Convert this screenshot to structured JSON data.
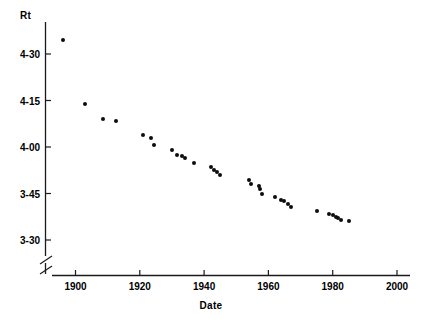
{
  "chart_data": {
    "type": "scatter",
    "title": "",
    "ylabel": "Rt",
    "xlabel": "Date",
    "xlim": [
      1893,
      2000
    ],
    "ylim_seconds": [
      200,
      280
    ],
    "y_axis_break": true,
    "grid": false,
    "legend": null,
    "yticks": [
      {
        "label": "4-30",
        "seconds": 270
      },
      {
        "label": "4-15",
        "seconds": 255
      },
      {
        "label": "4-00",
        "seconds": 240
      },
      {
        "label": "3-45",
        "seconds": 225
      },
      {
        "label": "3-30",
        "seconds": 210
      }
    ],
    "xticks": [
      {
        "label": "1900",
        "value": 1900
      },
      {
        "label": "1920",
        "value": 1920
      },
      {
        "label": "1940",
        "value": 1940
      },
      {
        "label": "1960",
        "value": 1960
      },
      {
        "label": "1980",
        "value": 1980
      },
      {
        "label": "2000",
        "value": 2000
      }
    ],
    "points": [
      {
        "x": 1896.0,
        "y": 274.5
      },
      {
        "x": 1903.0,
        "y": 254.0
      },
      {
        "x": 1908.5,
        "y": 249.0
      },
      {
        "x": 1912.5,
        "y": 248.5
      },
      {
        "x": 1921.0,
        "y": 244.0
      },
      {
        "x": 1923.5,
        "y": 243.0
      },
      {
        "x": 1924.5,
        "y": 240.5
      },
      {
        "x": 1930.0,
        "y": 239.0
      },
      {
        "x": 1931.5,
        "y": 237.5
      },
      {
        "x": 1933.0,
        "y": 237.0
      },
      {
        "x": 1934.0,
        "y": 236.5
      },
      {
        "x": 1937.0,
        "y": 235.0
      },
      {
        "x": 1942.0,
        "y": 233.5
      },
      {
        "x": 1943.0,
        "y": 232.5
      },
      {
        "x": 1944.0,
        "y": 232.0
      },
      {
        "x": 1945.0,
        "y": 231.0
      },
      {
        "x": 1954.0,
        "y": 229.5
      },
      {
        "x": 1954.5,
        "y": 228.0
      },
      {
        "x": 1957.0,
        "y": 227.5
      },
      {
        "x": 1957.5,
        "y": 226.5
      },
      {
        "x": 1958.0,
        "y": 225.0
      },
      {
        "x": 1962.0,
        "y": 224.0
      },
      {
        "x": 1964.0,
        "y": 223.0
      },
      {
        "x": 1965.0,
        "y": 222.5
      },
      {
        "x": 1966.0,
        "y": 221.5
      },
      {
        "x": 1967.0,
        "y": 220.5
      },
      {
        "x": 1975.0,
        "y": 219.5
      },
      {
        "x": 1979.0,
        "y": 218.5
      },
      {
        "x": 1980.0,
        "y": 218.0
      },
      {
        "x": 1981.0,
        "y": 217.5
      },
      {
        "x": 1981.8,
        "y": 217.0
      },
      {
        "x": 1982.5,
        "y": 216.5
      },
      {
        "x": 1985.0,
        "y": 216.0
      }
    ]
  },
  "axes": {
    "y_title": "Rt",
    "x_title": "Date"
  }
}
